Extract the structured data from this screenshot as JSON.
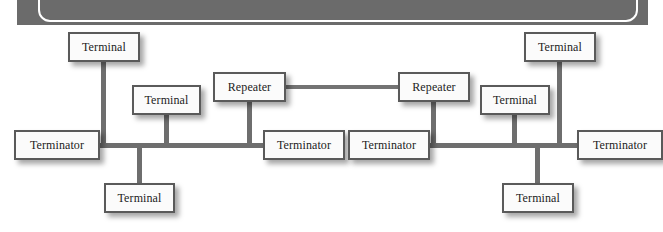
{
  "diagram": {
    "type": "network-topology",
    "banner": {
      "color": "#6b6b6b",
      "outline_color": "#ffffff"
    },
    "colors": {
      "wire": "#6e6e6e",
      "node_fill": "#fbfbfb",
      "node_border": "#5a5a5a",
      "text": "#1c1c1c",
      "background": "#ffffff"
    },
    "nodes": [
      {
        "id": "terminal-top-left",
        "label": "Terminal",
        "x": 68,
        "y": 32,
        "w": 72,
        "h": 30
      },
      {
        "id": "terminal-upper-left-2",
        "label": "Terminal",
        "x": 132,
        "y": 85,
        "w": 69,
        "h": 30
      },
      {
        "id": "repeater-left",
        "label": "Repeater",
        "x": 213,
        "y": 72,
        "w": 73,
        "h": 30
      },
      {
        "id": "repeater-right",
        "label": "Repeater",
        "x": 398,
        "y": 72,
        "w": 72,
        "h": 30
      },
      {
        "id": "terminal-top-right",
        "label": "Terminal",
        "x": 524,
        "y": 32,
        "w": 72,
        "h": 30
      },
      {
        "id": "terminal-mid-right",
        "label": "Terminal",
        "x": 480,
        "y": 85,
        "w": 70,
        "h": 30
      },
      {
        "id": "terminator-far-left",
        "label": "Terminator",
        "x": 14,
        "y": 130,
        "w": 86,
        "h": 30
      },
      {
        "id": "terminator-mid-left",
        "label": "Terminator",
        "x": 263,
        "y": 130,
        "w": 82,
        "h": 30
      },
      {
        "id": "terminator-mid-right",
        "label": "Terminator",
        "x": 348,
        "y": 130,
        "w": 82,
        "h": 30
      },
      {
        "id": "terminator-far-right",
        "label": "Terminator",
        "x": 577,
        "y": 130,
        "w": 86,
        "h": 30
      },
      {
        "id": "terminal-bottom-left",
        "label": "Terminal",
        "x": 104,
        "y": 183,
        "w": 71,
        "h": 30
      },
      {
        "id": "terminal-bottom-right",
        "label": "Terminal",
        "x": 502,
        "y": 183,
        "w": 72,
        "h": 30
      }
    ],
    "segments": [
      {
        "id": "bus-left",
        "from": "terminator-far-left",
        "to": "terminator-mid-left"
      },
      {
        "id": "bus-right",
        "from": "terminator-mid-right",
        "to": "terminator-far-right"
      },
      {
        "id": "repeater-link",
        "from": "repeater-left",
        "to": "repeater-right"
      }
    ],
    "labels": {
      "terminal": "Terminal",
      "terminator": "Terminator",
      "repeater": "Repeater"
    }
  }
}
